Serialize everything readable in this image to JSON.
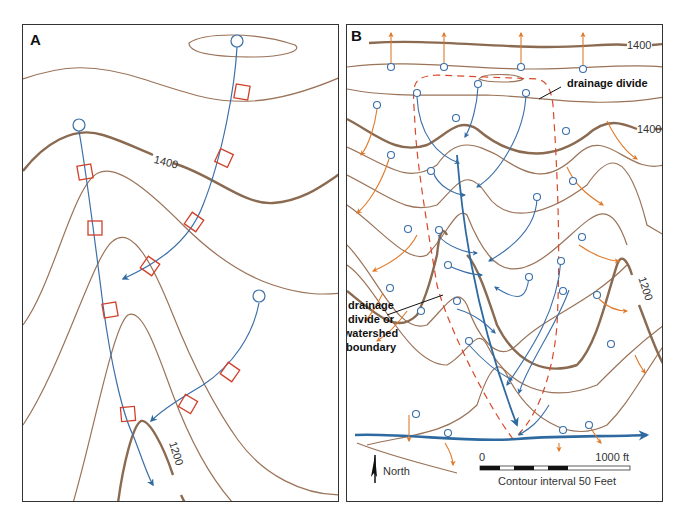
{
  "figure": {
    "panels": [
      {
        "id": "A",
        "label": "A",
        "contour_labels": [
          "1400",
          "1200"
        ]
      },
      {
        "id": "B",
        "label": "B",
        "contour_labels": [
          "1400",
          "1400",
          "1200"
        ],
        "annotations": {
          "drainage_divide": "drainage divide",
          "watershed_line1": "drainage",
          "watershed_line2": "divide or",
          "watershed_line3": "watershed",
          "watershed_line4": "boundary"
        },
        "north_label": "North",
        "scale": {
          "start": "0",
          "end": "1000 ft",
          "caption": "Contour interval 50 Feet"
        }
      }
    ],
    "colors": {
      "contour": "#9a7358",
      "index_contour": "#8a6a50",
      "stream": "#3a6fa8",
      "main_stream": "#2e6aa0",
      "outflow_arrow": "#e07a2a",
      "divide": "#d9482b",
      "crossing_square": "#d0402a",
      "frame": "#333333"
    }
  }
}
